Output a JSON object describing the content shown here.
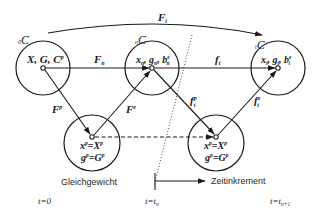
{
  "diagram": {
    "configurations": {
      "initial": {
        "label_sub": "0",
        "label_main": "C",
        "content": "X, G, C",
        "content_sup": "p"
      },
      "current": {
        "label_sub": "n",
        "label_main": "C",
        "content": "x",
        "content_sub": "n",
        "content_mid": ", g",
        "content_mid_sub": "n",
        "content_end": ", b",
        "content_end_sub": "n",
        "content_end_sup": "e"
      },
      "next": {
        "label_sub": "t",
        "label_main": "C",
        "content": "x",
        "content_sub": "t",
        "content_mid": ", g",
        "content_mid_sub": "t",
        "content_end": ", b",
        "content_end_sub": "t",
        "content_end_sup": "e"
      },
      "plastic_1": {
        "line1_lhs": "x",
        "line1_lhs_sup": "p",
        "line1_eq": "=",
        "line1_rhs": "X",
        "line1_rhs_sup": "p",
        "line2_lhs": "g",
        "line2_lhs_sup": "p",
        "line2_eq": "=",
        "line2_rhs": "G",
        "line2_rhs_sup": "p"
      },
      "plastic_2": {
        "line1_lhs": "x",
        "line1_lhs_sup": "p",
        "line1_eq": "=",
        "line1_rhs": "X",
        "line1_rhs_sup": "p",
        "line2_lhs": "g",
        "line2_lhs_sup": "p",
        "line2_eq": "=",
        "line2_rhs": "G",
        "line2_rhs_sup": "p"
      }
    },
    "maps": {
      "F_t": {
        "main": "F",
        "sub": "t"
      },
      "F_n": {
        "main": "F",
        "sub": "n"
      },
      "f_t": {
        "main": "f",
        "sub": "t"
      },
      "F_p": {
        "main": "F",
        "sup": "p"
      },
      "F_e": {
        "main": "F",
        "sup": "e"
      },
      "f_t_p": {
        "main": "f",
        "sub": "t",
        "sup": "p"
      },
      "f_t_e": {
        "main": "f",
        "sub": "t",
        "sup": "e"
      }
    },
    "annotations": {
      "equilibrium": "Gleichgewicht",
      "time_increment": "Zeitinkrement"
    },
    "time_labels": {
      "t0": "t=0",
      "tn_main": "t=t",
      "tn_sub": "n",
      "tn1_main": "t=t",
      "tn1_sub": "n+1"
    }
  }
}
